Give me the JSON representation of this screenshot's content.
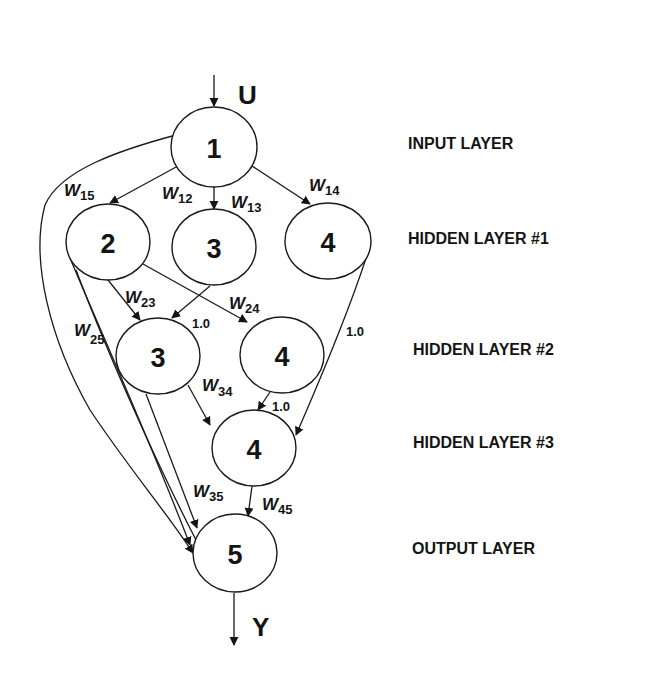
{
  "diagram": {
    "type": "neural-network-architecture",
    "input_label": "U",
    "output_label": "Y",
    "layers": [
      {
        "name": "INPUT LAYER",
        "nodes": [
          "1"
        ]
      },
      {
        "name": "HIDDEN LAYER #1",
        "nodes": [
          "2",
          "3",
          "4"
        ]
      },
      {
        "name": "HIDDEN LAYER #2",
        "nodes": [
          "3",
          "4"
        ]
      },
      {
        "name": "HIDDEN LAYER #3",
        "nodes": [
          "4"
        ]
      },
      {
        "name": "OUTPUT LAYER",
        "nodes": [
          "5"
        ]
      }
    ],
    "nodes": {
      "input_1": "1",
      "h1_2": "2",
      "h1_3": "3",
      "h1_4": "4",
      "h2_3": "3",
      "h2_4": "4",
      "h3_4": "4",
      "out_5": "5"
    },
    "edges": [
      {
        "from": "1",
        "to": "2 (HL1)",
        "label": "W15"
      },
      {
        "from": "1",
        "to": "3 (HL1)",
        "label": "W12"
      },
      {
        "from": "1",
        "to": "4 (HL1)",
        "label": "W14"
      },
      {
        "from": "1",
        "to": "5",
        "label": "W13"
      },
      {
        "from": "2 (HL1)",
        "to": "3 (HL2)",
        "label": "W23"
      },
      {
        "from": "2 (HL1)",
        "to": "4 (HL2)",
        "label": "W24"
      },
      {
        "from": "2 (HL1)",
        "to": "5",
        "label": "W25"
      },
      {
        "from": "3 (HL1)",
        "to": "3 (HL2)",
        "label": "1.0"
      },
      {
        "from": "4 (HL1)",
        "to": "4 (HL3)",
        "label": "1.0"
      },
      {
        "from": "3 (HL2)",
        "to": "4 (HL3)",
        "label": "W34"
      },
      {
        "from": "3 (HL2)",
        "to": "5",
        "label": "W35"
      },
      {
        "from": "4 (HL2)",
        "to": "4 (HL3)",
        "label": "1.0"
      },
      {
        "from": "4 (HL3)",
        "to": "5",
        "label": "W45"
      }
    ],
    "weights": {
      "w15": {
        "base": "W",
        "sub": "15"
      },
      "w12": {
        "base": "W",
        "sub": "12"
      },
      "w13": {
        "base": "W",
        "sub": "13"
      },
      "w14": {
        "base": "W",
        "sub": "14"
      },
      "w23": {
        "base": "W",
        "sub": "23"
      },
      "w24": {
        "base": "W",
        "sub": "24"
      },
      "w25": {
        "base": "W",
        "sub": "25"
      },
      "w34": {
        "base": "W",
        "sub": "34"
      },
      "w35": {
        "base": "W",
        "sub": "35"
      },
      "w45": {
        "base": "W",
        "sub": "45"
      }
    },
    "constants": {
      "c_h1_3_to_h2_3": "1.0",
      "c_h1_4_to_h3_4": "1.0",
      "c_h2_4_to_h3_4": "1.0"
    },
    "layer_labels": {
      "input": "INPUT LAYER",
      "hidden1": "HIDDEN LAYER #1",
      "hidden2": "HIDDEN LAYER #2",
      "hidden3": "HIDDEN LAYER #3",
      "output": "OUTPUT LAYER"
    },
    "colors": {
      "ink": "#141414",
      "background": "#ffffff"
    }
  }
}
